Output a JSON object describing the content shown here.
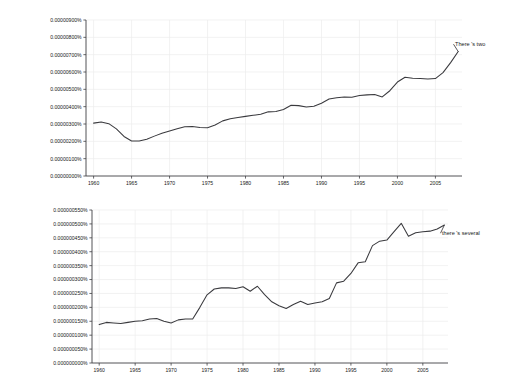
{
  "chart_data": [
    {
      "type": "line",
      "id": "top",
      "title": "",
      "xlabel": "",
      "ylabel": "",
      "legend_position": "right-end-of-line",
      "grid": true,
      "series_label": "There 's two",
      "xlim": [
        1959,
        2008.5
      ],
      "ylim": [
        0.0,
        9e-06
      ],
      "ytick_values": [
        0,
        1e-06,
        2e-06,
        3e-06,
        4e-06,
        5e-06,
        6e-06,
        7e-06,
        8e-06,
        9e-06
      ],
      "ytick_labels": [
        "0.00000000%",
        "0.00000100%",
        "0.00000200%",
        "0.00000300%",
        "0.00000400%",
        "0.00000500%",
        "0.00000600%",
        "0.00000700%",
        "0.00000800%",
        "0.00000900%"
      ],
      "xtick_values": [
        1960,
        1965,
        1970,
        1975,
        1980,
        1985,
        1990,
        1995,
        2000,
        2005
      ],
      "xtick_labels": [
        "1960",
        "1965",
        "1970",
        "1975",
        "1980",
        "1985",
        "1990",
        "1995",
        "2000",
        "2005"
      ],
      "x": [
        1960,
        1961,
        1962,
        1963,
        1964,
        1965,
        1966,
        1967,
        1968,
        1969,
        1970,
        1971,
        1972,
        1973,
        1974,
        1975,
        1976,
        1977,
        1978,
        1979,
        1980,
        1981,
        1982,
        1983,
        1984,
        1985,
        1986,
        1987,
        1988,
        1989,
        1990,
        1991,
        1992,
        1993,
        1994,
        1995,
        1996,
        1997,
        1998,
        1999,
        2000,
        2001,
        2002,
        2003,
        2004,
        2005,
        2006,
        2007,
        2008
      ],
      "values": [
        3.05e-06,
        3.12e-06,
        3.02e-06,
        2.72e-06,
        2.28e-06,
        2.02e-06,
        2.02e-06,
        2.12e-06,
        2.3e-06,
        2.46e-06,
        2.6e-06,
        2.73e-06,
        2.84e-06,
        2.86e-06,
        2.8e-06,
        2.78e-06,
        2.94e-06,
        3.18e-06,
        3.3e-06,
        3.38e-06,
        3.44e-06,
        3.5e-06,
        3.56e-06,
        3.7e-06,
        3.72e-06,
        3.84e-06,
        4.08e-06,
        4.06e-06,
        3.98e-06,
        4.02e-06,
        4.2e-06,
        4.44e-06,
        4.52e-06,
        4.56e-06,
        4.54e-06,
        4.64e-06,
        4.68e-06,
        4.7e-06,
        4.56e-06,
        4.92e-06,
        5.42e-06,
        5.7e-06,
        5.64e-06,
        5.62e-06,
        5.6e-06,
        5.62e-06,
        5.96e-06,
        6.54e-06,
        7.18e-06
      ]
    },
    {
      "type": "line",
      "id": "bottom",
      "title": "",
      "xlabel": "",
      "ylabel": "",
      "legend_position": "right-end-of-line",
      "grid": true,
      "series_label": "there 's several",
      "xlim": [
        1959,
        2008.5
      ],
      "ylim": [
        0.0,
        5.5e-07
      ],
      "ytick_values": [
        0,
        5e-08,
        1e-07,
        1.5e-07,
        2e-07,
        2.5e-07,
        3e-07,
        3.5e-07,
        4e-07,
        4.5e-07,
        5e-07,
        5.5e-07
      ],
      "ytick_labels": [
        "0.000000000%",
        "0.000000050%",
        "0.000000100%",
        "0.000000150%",
        "0.000000200%",
        "0.000000250%",
        "0.000000300%",
        "0.000000350%",
        "0.000000400%",
        "0.000000450%",
        "0.000000500%",
        "0.000000550%"
      ],
      "xtick_values": [
        1960,
        1965,
        1970,
        1975,
        1980,
        1985,
        1990,
        1995,
        2000,
        2005
      ],
      "xtick_labels": [
        "1960",
        "1965",
        "1970",
        "1975",
        "1980",
        "1985",
        "1990",
        "1995",
        "2000",
        "2005"
      ],
      "x": [
        1960,
        1961,
        1962,
        1963,
        1964,
        1965,
        1966,
        1967,
        1968,
        1969,
        1970,
        1971,
        1972,
        1973,
        1974,
        1975,
        1976,
        1977,
        1978,
        1979,
        1980,
        1981,
        1982,
        1983,
        1984,
        1985,
        1986,
        1987,
        1988,
        1989,
        1990,
        1991,
        1992,
        1993,
        1994,
        1995,
        1996,
        1997,
        1998,
        1999,
        2000,
        2001,
        2002,
        2003,
        2004,
        2005,
        2006,
        2007,
        2008
      ],
      "values": [
        1.38e-07,
        1.46e-07,
        1.44e-07,
        1.42e-07,
        1.46e-07,
        1.5e-07,
        1.52e-07,
        1.58e-07,
        1.6e-07,
        1.5e-07,
        1.44e-07,
        1.55e-07,
        1.58e-07,
        1.58e-07,
        2e-07,
        2.45e-07,
        2.66e-07,
        2.7e-07,
        2.7e-07,
        2.68e-07,
        2.74e-07,
        2.58e-07,
        2.76e-07,
        2.46e-07,
        2.2e-07,
        2.06e-07,
        1.96e-07,
        2.1e-07,
        2.22e-07,
        2.1e-07,
        2.16e-07,
        2.2e-07,
        2.32e-07,
        2.88e-07,
        2.94e-07,
        3.22e-07,
        3.6e-07,
        3.64e-07,
        4.22e-07,
        4.38e-07,
        4.42e-07,
        4.72e-07,
        5.02e-07,
        4.56e-07,
        4.68e-07,
        4.72e-07,
        4.74e-07,
        4.82e-07,
        4.96e-07
      ]
    }
  ]
}
